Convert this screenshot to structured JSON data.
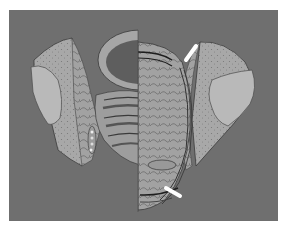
{
  "figure": {
    "colors": {
      "background": "#ffffff",
      "panel": "#6f6f6f",
      "bone_cortex": "#a9a9a9",
      "bone_head": "#b8b8b8",
      "tissue": "#9a9a9a",
      "dark_line": "#2e2e2e",
      "arrow": "#ffffff"
    },
    "arrows": [
      {
        "id": "upper",
        "direction": "down-left",
        "x": 190,
        "y": 52
      },
      {
        "id": "lower",
        "direction": "up-left",
        "x": 163,
        "y": 185
      }
    ]
  }
}
